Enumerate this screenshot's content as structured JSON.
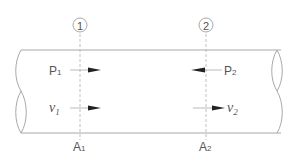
{
  "diagram": {
    "type": "pipe flow cross-sections",
    "sections": [
      {
        "marker": "1",
        "pressure_label": "P",
        "pressure_sub": "1",
        "pressure_direction": "right",
        "velocity_label": "v",
        "velocity_sub": "1",
        "velocity_direction": "right",
        "area_label": "A",
        "area_sub": "1"
      },
      {
        "marker": "2",
        "pressure_label": "P",
        "pressure_sub": "2",
        "pressure_direction": "left",
        "velocity_label": "v",
        "velocity_sub": "2",
        "velocity_direction": "right",
        "area_label": "A",
        "area_sub": "2"
      }
    ],
    "colors": {
      "line": "#a8a8a8",
      "text": "#555555",
      "arrow": "#222222"
    }
  }
}
